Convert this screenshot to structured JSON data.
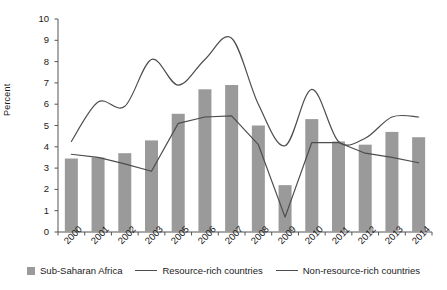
{
  "chart_data": {
    "type": "bar",
    "title": "",
    "subtitle": "",
    "xlabel": "",
    "ylabel": "Percent",
    "ylim": [
      0,
      10
    ],
    "yticks": [
      0,
      1,
      2,
      3,
      4,
      5,
      6,
      7,
      8,
      9,
      10
    ],
    "grid": false,
    "legend_position": "bottom",
    "categories": [
      "2000",
      "2001",
      "2002",
      "2003",
      "2005",
      "2006",
      "2007",
      "2008",
      "2009",
      "2010",
      "2011",
      "2012",
      "2013",
      "2014"
    ],
    "series": [
      {
        "name": "Sub-Saharan Africa",
        "type": "bar",
        "color": "#9a9a9a",
        "values": [
          3.45,
          3.5,
          3.7,
          4.3,
          5.55,
          6.7,
          6.9,
          5.0,
          2.2,
          5.3,
          4.25,
          4.1,
          4.7,
          4.45
        ]
      },
      {
        "name": "Resource-rich countries",
        "type": "line",
        "color": "#4d4d4d",
        "smooth": true,
        "values": [
          4.25,
          6.1,
          5.9,
          8.1,
          6.9,
          8.1,
          9.1,
          6.0,
          4.05,
          6.7,
          4.25,
          4.4,
          5.4,
          5.4
        ]
      },
      {
        "name": "Non-resource-rich countries",
        "type": "line",
        "color": "#4d4d4d",
        "smooth": false,
        "values": [
          3.65,
          3.5,
          3.2,
          2.85,
          5.1,
          5.4,
          5.45,
          4.1,
          0.7,
          4.2,
          4.2,
          3.7,
          3.5,
          3.25
        ]
      }
    ]
  },
  "legend": {
    "items": [
      {
        "label": "Sub-Saharan Africa",
        "marker": "bar-swatch"
      },
      {
        "label": "Resource-rich countries",
        "marker": "line-swatch"
      },
      {
        "label": "Non-resource-rich countries",
        "marker": "line-swatch"
      }
    ]
  },
  "colors": {
    "bar": "#9a9a9a",
    "line": "#4d4d4d",
    "axis": "#555555",
    "text": "#1a1a1a",
    "background": "#ffffff"
  }
}
